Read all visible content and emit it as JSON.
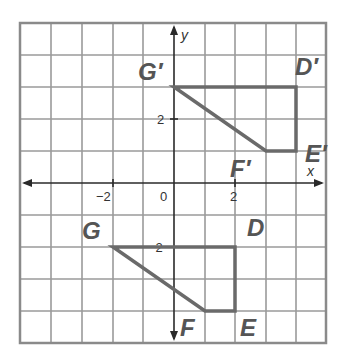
{
  "diagram": {
    "type": "coordinate-plane-translation",
    "axes": {
      "x_label": "x",
      "y_label": "y",
      "x_range": [
        -5,
        5
      ],
      "y_range": [
        -5,
        5
      ],
      "tick_labels": {
        "x_neg2": "−2",
        "origin": "0",
        "x_pos2": "2",
        "y_pos2": "2",
        "y_neg2": "−2"
      }
    },
    "original_figure": {
      "name": "DEFG",
      "vertices": [
        {
          "label": "D",
          "x": 2,
          "y": -2
        },
        {
          "label": "E",
          "x": 2,
          "y": -4
        },
        {
          "label": "F",
          "x": 1,
          "y": -4
        },
        {
          "label": "G",
          "x": -2,
          "y": -2
        }
      ]
    },
    "image_figure": {
      "name": "D'E'F'G'",
      "vertices": [
        {
          "label": "D′",
          "x": 4,
          "y": 3
        },
        {
          "label": "E′",
          "x": 4,
          "y": 1
        },
        {
          "label": "F′",
          "x": 3,
          "y": 1
        },
        {
          "label": "G′",
          "x": 0,
          "y": 3
        }
      ]
    },
    "labels": {
      "G": "G",
      "D": "D",
      "E": "E",
      "F": "F",
      "Gp": "G′",
      "Dp": "D′",
      "Ep": "E′",
      "Fp": "F′"
    },
    "colors": {
      "grid": "#9a9a9a",
      "axes": "#2a2a2a",
      "shape_stroke": "#6a6a6a",
      "label": "#555555"
    }
  }
}
